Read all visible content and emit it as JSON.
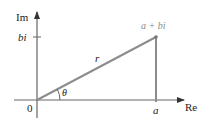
{
  "diagram": {
    "type": "complex-plane-polar-representation",
    "axes": {
      "real_label": "Re",
      "imaginary_label": "Im",
      "origin_label": "0"
    },
    "ticks": {
      "real_tick_label": "a",
      "imaginary_tick_label": "bi"
    },
    "point": {
      "label": "a + bi"
    },
    "segments": {
      "radius_label": "r",
      "angle_label": "θ"
    },
    "colors": {
      "axis": "#555555",
      "radius": "#8c8c8c",
      "text": "#222222",
      "point_label": "#8a8a8a"
    }
  }
}
